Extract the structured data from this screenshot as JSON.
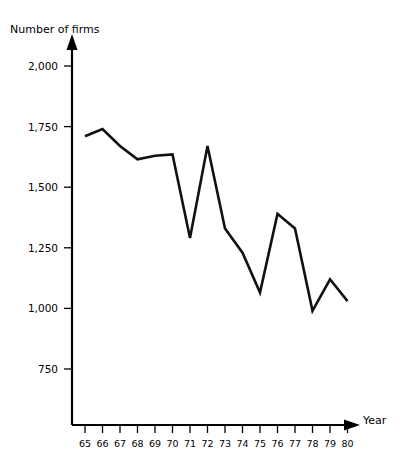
{
  "chart_data": {
    "type": "line",
    "title": "",
    "xlabel": "Year",
    "ylabel": "Number of firms",
    "categories": [
      "65",
      "66",
      "67",
      "68",
      "69",
      "70",
      "71",
      "72",
      "73",
      "74",
      "75",
      "76",
      "77",
      "78",
      "79",
      "80"
    ],
    "values": [
      1710,
      1740,
      1670,
      1615,
      1630,
      1635,
      1290,
      1670,
      1330,
      1230,
      1065,
      1390,
      1330,
      990,
      1120,
      1030
    ],
    "series": [
      {
        "name": "Number of firms",
        "values": [
          1710,
          1740,
          1670,
          1615,
          1630,
          1635,
          1290,
          1670,
          1330,
          1230,
          1065,
          1390,
          1330,
          990,
          1120,
          1030
        ]
      }
    ],
    "ytick_labels": [
      "2,000",
      "1,750",
      "1,500",
      "1,250",
      "1,000",
      "750"
    ],
    "ytick_values": [
      2000,
      1750,
      1500,
      1250,
      1000,
      750
    ],
    "ylim": [
      625,
      2075
    ],
    "xlim": [
      "65",
      "80"
    ],
    "grid": false,
    "legend": false,
    "legend_position": "none",
    "line_color": "#111111",
    "axis_color": "#000000",
    "background_color": "#ffffff"
  },
  "axes": {
    "y_axis_label": "Number of firms",
    "x_axis_label": "Year"
  }
}
